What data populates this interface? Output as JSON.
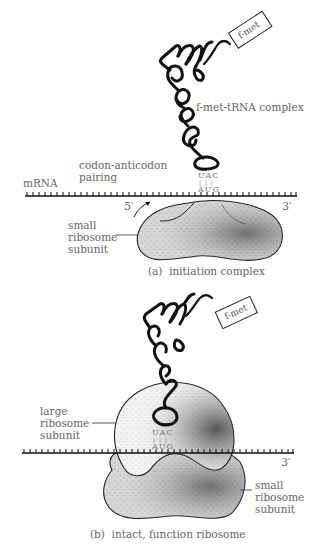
{
  "panel_a": {
    "tag": "f-met",
    "trna_label": "f-met-tRNA complex",
    "pairing_label_1": "codon-anticodon",
    "pairing_label_2": "pairing",
    "mrna_label": "mRNA",
    "anticodon": "UAC",
    "pair_marks": "| | |",
    "codon": "AUG",
    "five_prime": "5′",
    "three_prime": "3′",
    "small_subunit": [
      "small",
      "ribosome",
      "subunit"
    ],
    "caption": "(a)  initiation complex"
  },
  "panel_b": {
    "tag": "f-met",
    "large_subunit": [
      "large",
      "ribosome",
      "subunit"
    ],
    "anticodon": "UAC",
    "pair_marks": "| | |",
    "codon": "AUG",
    "three_prime": "3′",
    "small_subunit": [
      "small",
      "ribosome",
      "subunit"
    ],
    "caption": "(b)  intact, function ribosome"
  },
  "colors": {
    "subunit_fill": "#d6d6d6",
    "large_fill": "#f2f2f2",
    "ink": "#111111",
    "label": "#666666"
  }
}
